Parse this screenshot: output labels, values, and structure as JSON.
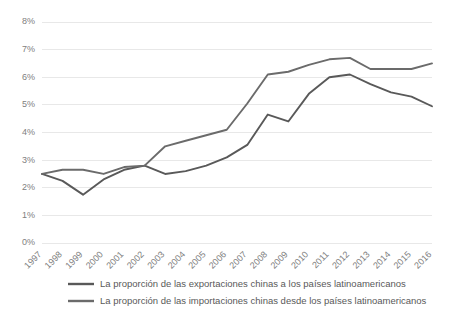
{
  "chart_data": {
    "type": "line",
    "title": "",
    "subtitle": "",
    "xlabel": "",
    "ylabel": "",
    "grid": true,
    "legend_position": "bottom",
    "ylim": [
      0,
      8
    ],
    "ytick_labels": [
      "0%",
      "1%",
      "2%",
      "3%",
      "4%",
      "5%",
      "6%",
      "7%",
      "8%"
    ],
    "ytick_values": [
      0,
      1,
      2,
      3,
      4,
      5,
      6,
      7,
      8
    ],
    "categories": [
      "1997",
      "1998",
      "1999",
      "2000",
      "2001",
      "2002",
      "2003",
      "2004",
      "2005",
      "2006",
      "2007",
      "2008",
      "2009",
      "2010",
      "2011",
      "2012",
      "2013",
      "2014",
      "2015",
      "2016"
    ],
    "series": [
      {
        "name": "La proporción de las exportaciones chinas a los países latinoamericanos",
        "color": "#595959",
        "values": [
          2.5,
          2.25,
          1.75,
          2.3,
          2.65,
          2.8,
          2.5,
          2.6,
          2.8,
          3.1,
          3.55,
          4.65,
          4.4,
          5.4,
          6.0,
          6.1,
          5.75,
          5.45,
          5.3,
          4.95
        ]
      },
      {
        "name": "La proporción de las importaciones chinas desde los países latinoamericanos",
        "color": "#6b6b6b",
        "values": [
          2.5,
          2.65,
          2.65,
          2.5,
          2.75,
          2.8,
          3.5,
          3.7,
          3.9,
          4.1,
          5.05,
          6.1,
          6.2,
          6.45,
          6.65,
          6.7,
          6.3,
          6.3,
          6.3,
          6.5
        ]
      }
    ]
  },
  "legend": {
    "entries": [
      {
        "label": "La proporción de las exportaciones chinas a los países latinoamericanos",
        "color": "#595959"
      },
      {
        "label": "La proporción de las importaciones chinas desde los países latinoamericanos",
        "color": "#6b6b6b"
      }
    ]
  }
}
